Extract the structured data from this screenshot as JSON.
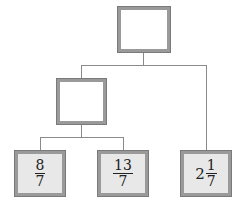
{
  "tree": {
    "root": {
      "label": ""
    },
    "middle": {
      "label": ""
    },
    "leaves": [
      {
        "whole": "",
        "numerator": "8",
        "denominator": "7"
      },
      {
        "whole": "",
        "numerator": "13",
        "denominator": "7"
      },
      {
        "whole": "2",
        "numerator": "1",
        "denominator": "7"
      }
    ]
  },
  "colors": {
    "border": "#9a9a9a",
    "leaf_fill": "#e8e8e8",
    "line": "#8a8a8a"
  }
}
